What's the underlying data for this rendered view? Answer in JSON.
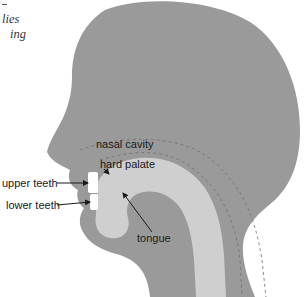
{
  "caption": {
    "line1": "lies",
    "line2": "ing"
  },
  "labels": {
    "nasal_cavity": "nasal cavity",
    "hard_palate": "hard palate",
    "upper_teeth": "upper teeth",
    "lower_teeth": "lower teeth",
    "tongue": "tongue"
  },
  "colors": {
    "head": "#9a9a9a",
    "tract": "#cfcfcf",
    "teeth": "#ffffff",
    "background": "#ffffff",
    "label_text": "#1a1a1a"
  }
}
